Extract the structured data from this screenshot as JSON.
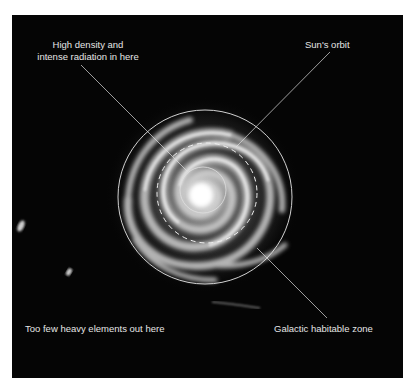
{
  "diagram": {
    "labels": {
      "core": "High density and\nintense radiation in here",
      "core_line1": "High density and",
      "core_line2": "intense radiation in here",
      "sun_orbit": "Sun's orbit",
      "outer": "Too few heavy elements out here",
      "habitable_zone": "Galactic habitable zone"
    },
    "colors": {
      "background": "#050505",
      "page": "#ffffff",
      "annotation": "#e6e6e6"
    },
    "shapes": {
      "habitable_zone_circle": {
        "cx": 205,
        "cy": 197,
        "r": 87
      },
      "sun_orbit_dashed_circle": {
        "cx": 207,
        "cy": 193,
        "r": 50
      },
      "core_circle": {
        "cx": 203,
        "cy": 190,
        "r": 23
      }
    }
  }
}
